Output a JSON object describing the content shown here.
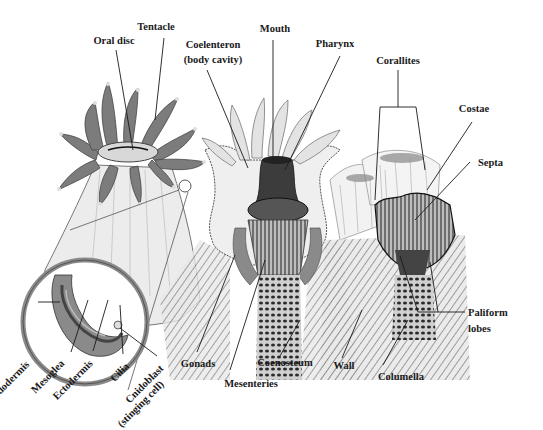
{
  "diagram": {
    "panels": [
      {
        "id": "polyp-exterior",
        "description": "Living polyp with tentacles and magnified tissue layers"
      },
      {
        "id": "polyp-cross-section",
        "description": "Cut-away polyp showing internal anatomy"
      },
      {
        "id": "skeleton",
        "description": "Calcium carbonate corallite skeleton"
      }
    ],
    "labels": {
      "oral_disc": "Oral disc",
      "tentacle": "Tentacle",
      "coelenteron_line1": "Coelenteron",
      "coelenteron_line2": "(body cavity)",
      "mouth": "Mouth",
      "pharynx": "Pharynx",
      "corallites": "Corallites",
      "costae": "Costae",
      "septa": "Septa",
      "paliform_line1": "Paliform",
      "paliform_line2": "lobes",
      "endodermis": "Endodermis",
      "mesoglea": "Mesoglea",
      "ectodermis": "Ectodermis",
      "cilia": "Cilia",
      "cnidoblast_line1": "Cnidoblast",
      "cnidoblast_line2": "(stinging cell)",
      "gonads": "Gonads",
      "mesenteries": "Mesenteries",
      "coenosteum": "Coenosteum",
      "wall": "Wall",
      "columella": "Columella"
    },
    "colors": {
      "ink": "#1a1a1a",
      "tissue_dark": "#6e6e6e",
      "tissue_mid": "#9a9a9a",
      "tissue_light": "#d4d4d4",
      "background": "#ffffff"
    }
  }
}
